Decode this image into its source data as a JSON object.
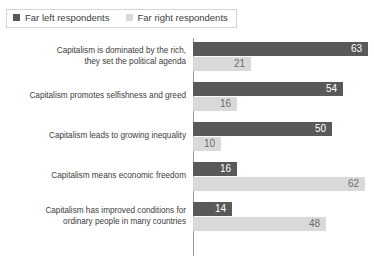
{
  "legend": {
    "position": "top-left",
    "entries": [
      {
        "label": "Far left respondents",
        "color": "#595959",
        "icon": "square-swatch-icon"
      },
      {
        "label": "Far right respondents",
        "color": "#d9d9d9",
        "icon": "square-swatch-icon"
      }
    ]
  },
  "chart_data": {
    "type": "bar",
    "orientation": "horizontal",
    "title": "",
    "subtitle": "",
    "xlabel": "",
    "ylabel": "",
    "xlim": [
      0,
      63
    ],
    "grid": false,
    "legend_position": "top-left",
    "categories": [
      "Capitalism is dominated by the rich, they set the political agenda",
      "Capitalism promotes selfishness and greed",
      "Capitalism leads to growing inequality",
      "Capitalism means economic freedom",
      "Capitalism has improved conditions for ordinary people in many countries"
    ],
    "category_lines": [
      [
        "Capitalism is dominated by the rich,",
        "they set the political agenda"
      ],
      [
        "Capitalism promotes selfishness and greed"
      ],
      [
        "Capitalism leads to growing inequality"
      ],
      [
        "Capitalism means economic freedom"
      ],
      [
        "Capitalism has improved conditions for",
        "ordinary people in many countries"
      ]
    ],
    "series": [
      {
        "name": "Far left respondents",
        "color": "#595959",
        "values": [
          63,
          54,
          50,
          16,
          14
        ]
      },
      {
        "name": "Far right respondents",
        "color": "#d9d9d9",
        "values": [
          21,
          16,
          10,
          62,
          48
        ]
      }
    ]
  }
}
